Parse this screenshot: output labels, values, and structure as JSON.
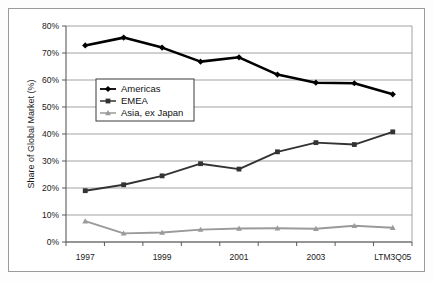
{
  "chart_data": {
    "type": "line",
    "title": "",
    "subtitle": "",
    "xlabel": "",
    "ylabel": "Share of Global Market (%)",
    "x": [
      "1997",
      "1998",
      "1999",
      "2000",
      "2001",
      "2002",
      "2003",
      "2004",
      "LTM3Q05"
    ],
    "categories": [
      "1997",
      "1998",
      "1999",
      "2000",
      "2001",
      "2002",
      "2003",
      "2004",
      "LTM3Q05"
    ],
    "xtick_labels": [
      "1997",
      "",
      "1999",
      "",
      "2001",
      "",
      "2003",
      "",
      "LTM3Q05"
    ],
    "ytick_labels": [
      "0%",
      "10%",
      "20%",
      "30%",
      "40%",
      "50%",
      "60%",
      "70%",
      "80%"
    ],
    "ytick_values": [
      0,
      10,
      20,
      30,
      40,
      50,
      60,
      70,
      80
    ],
    "ylim": [
      0,
      80
    ],
    "grid": "horizontal",
    "legend_position": "upper-left-inside",
    "series": [
      {
        "name": "Americas",
        "color": "#000000",
        "marker": "diamond",
        "values": [
          72.8,
          75.7,
          72.0,
          66.8,
          68.4,
          62.0,
          59.0,
          58.8,
          54.7
        ]
      },
      {
        "name": "EMEA",
        "color": "#333333",
        "marker": "square",
        "values": [
          19.0,
          21.2,
          24.5,
          29.0,
          27.0,
          33.4,
          36.8,
          36.1,
          40.8
        ]
      },
      {
        "name": "Asia, ex Japan",
        "color": "#9a9a9a",
        "marker": "triangle",
        "values": [
          7.7,
          3.2,
          3.5,
          4.6,
          5.0,
          5.1,
          4.9,
          6.0,
          5.3
        ]
      }
    ]
  },
  "legend": {
    "entries": [
      "Americas",
      "EMEA",
      "Asia, ex Japan"
    ]
  }
}
